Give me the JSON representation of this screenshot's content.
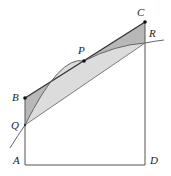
{
  "diagram": {
    "points": {
      "A": {
        "label": "A",
        "x": 25,
        "y": 165
      },
      "B": {
        "label": "B",
        "x": 25,
        "y": 98
      },
      "C": {
        "label": "C",
        "x": 145,
        "y": 22
      },
      "D": {
        "label": "D",
        "x": 145,
        "y": 165
      },
      "P": {
        "label": "P",
        "x": 84,
        "y": 61
      },
      "Q": {
        "label": "Q",
        "x": 25,
        "y": 125
      },
      "R": {
        "label": "R",
        "x": 145,
        "y": 43
      }
    },
    "colors": {
      "dark_shade": "#b8b8b8",
      "light_shade": "#dcdcdc",
      "line": "#444444",
      "curve": "#666666"
    }
  }
}
